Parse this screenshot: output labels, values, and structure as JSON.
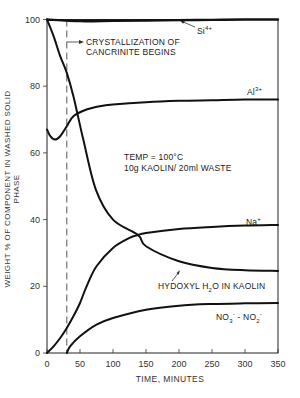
{
  "chart_data": {
    "type": "line",
    "title": "",
    "xlabel": "TIME, MINUTES",
    "ylabel": "WEIGHT % OF COMPONENT IN WASHED SOLID PHASE",
    "xlim": [
      0,
      350
    ],
    "ylim": [
      0,
      100
    ],
    "x_ticks": [
      0,
      50,
      100,
      150,
      200,
      250,
      300,
      350
    ],
    "y_ticks": [
      0,
      20,
      40,
      60,
      80,
      100
    ],
    "grid": false,
    "legend_position": "inline labels",
    "series": [
      {
        "name": "Si4+",
        "x": [
          0,
          50,
          100,
          150,
          200,
          250,
          300,
          350
        ],
        "y": [
          100,
          99.5,
          99.6,
          99.7,
          99.8,
          99.9,
          100,
          100
        ]
      },
      {
        "name": "Al3+",
        "x": [
          0,
          5,
          12,
          20,
          30,
          40,
          60,
          80,
          100,
          150,
          200,
          250,
          300,
          350
        ],
        "y": [
          67,
          65,
          64,
          65,
          68,
          71,
          73,
          74,
          74.5,
          75.2,
          75.6,
          75.8,
          76,
          76
        ]
      },
      {
        "name": "Na+",
        "x": [
          0,
          10,
          20,
          30,
          40,
          50,
          60,
          75,
          100,
          125,
          138,
          150,
          200,
          250,
          300,
          350
        ],
        "y": [
          0,
          2,
          4.5,
          7.5,
          11,
          15,
          20,
          26,
          31.5,
          34.5,
          35.4,
          36,
          37.2,
          37.8,
          38.2,
          38.4
        ]
      },
      {
        "name": "Hydroxyl H2O in Kaolin",
        "x": [
          0,
          10,
          20,
          30,
          40,
          55,
          74,
          100,
          126,
          138,
          150,
          200,
          250,
          300,
          350
        ],
        "y": [
          100,
          95,
          89,
          84,
          77,
          64,
          49,
          40,
          34,
          35.4,
          32,
          27.5,
          25.5,
          24.8,
          24.6
        ]
      },
      {
        "name": "NO3- - NO2-",
        "x": [
          30,
          35,
          50,
          75,
          100,
          150,
          200,
          250,
          300,
          350
        ],
        "y": [
          0,
          2,
          5,
          8.5,
          10.5,
          13,
          14.2,
          14.7,
          14.9,
          15
        ]
      }
    ],
    "annotations": [
      {
        "text": "CRYSTALLIZATION OF CANCRINITE BEGINS",
        "x": 30,
        "style": "dashed vertical line with arrow"
      },
      {
        "text": "TEMP = 100°C",
        "x": 105,
        "y": 61
      },
      {
        "text": "10g KAOLIN/20ml WASTE",
        "x": 105,
        "y": 57
      },
      {
        "text": "Si4+",
        "x": 185,
        "y": 97
      },
      {
        "text": "Al3+",
        "x": 305,
        "y": 79
      },
      {
        "text": "Na+",
        "x": 305,
        "y": 41
      },
      {
        "text": "HYDOXYL H2O IN KAOLIN",
        "x": 170,
        "y": 18
      },
      {
        "text": "NO3- - NO2-",
        "x": 270,
        "y": 9
      }
    ]
  },
  "labels": {
    "ylabel": "WEIGHT % OF COMPONENT IN WASHED SOLID PHASE",
    "xlabel": "TIME, MINUTES",
    "crystal_line1": "CRYSTALLIZATION OF",
    "crystal_line2": "CANCRINITE BEGINS",
    "temp": "TEMP = 100°C",
    "ratio": "10g KAOLIN/ 20ml WASTE",
    "si": "Si",
    "si_sup": "4+",
    "al": "Al",
    "al_sup": "3+",
    "na": "Na",
    "na_sup": "+",
    "hyd_a": "HYDOXYL H",
    "hyd_sub": "2",
    "hyd_b": "O IN KAOLIN",
    "no3": "NO",
    "no3_sub": "3",
    "no3_sup": "-",
    "dash": " - NO",
    "no2_sub": "2",
    "no2_sup": "-"
  },
  "axis": {
    "x_ticks": [
      "0",
      "50",
      "100",
      "150",
      "200",
      "250",
      "300",
      "350"
    ],
    "y_ticks": [
      "0",
      "20",
      "40",
      "60",
      "80",
      "100"
    ]
  }
}
